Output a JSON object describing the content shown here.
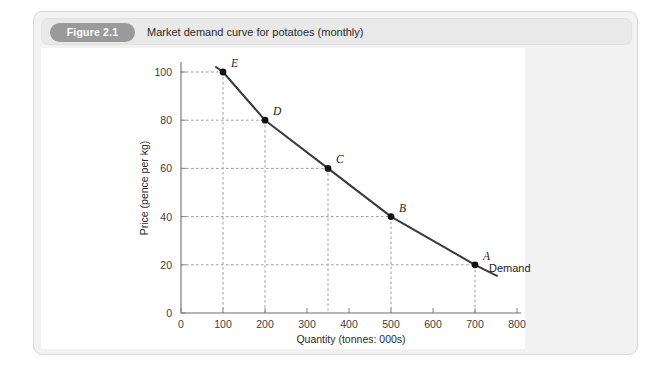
{
  "figure": {
    "badge": "Figure 2.1",
    "title": "Market demand curve for potatoes (monthly)"
  },
  "colors": {
    "card_background": "#f2f2f2",
    "header_background": "#e9e9e9",
    "badge_background": "#9a9a9a",
    "plot_background": "#ffffff",
    "curve": "#3a3a3a",
    "gridline": "#9b9b9b",
    "axis": "#6f6f6f"
  },
  "chart_data": {
    "type": "line",
    "title": "Market demand curve for potatoes (monthly)",
    "xlabel": "Quantity (tonnes: 000s)",
    "ylabel": "Price (pence per kg)",
    "xlim": [
      0,
      800
    ],
    "ylim": [
      0,
      110
    ],
    "xticks": [
      0,
      100,
      200,
      300,
      400,
      500,
      600,
      700,
      800
    ],
    "yticks": [
      0,
      20,
      40,
      60,
      80,
      100
    ],
    "grid": "dashed-to-axes",
    "legend": "inline-label",
    "series": [
      {
        "name": "Demand",
        "label": "Demand",
        "points": [
          {
            "label": "E",
            "x": 100,
            "y": 100
          },
          {
            "label": "D",
            "x": 200,
            "y": 80
          },
          {
            "label": "C",
            "x": 350,
            "y": 60
          },
          {
            "label": "B",
            "x": 500,
            "y": 40
          },
          {
            "label": "A",
            "x": 700,
            "y": 20
          }
        ]
      }
    ],
    "annotations": [
      {
        "text": "E",
        "x": 100,
        "y": 100
      },
      {
        "text": "D",
        "x": 200,
        "y": 80
      },
      {
        "text": "C",
        "x": 350,
        "y": 60
      },
      {
        "text": "B",
        "x": 500,
        "y": 40
      },
      {
        "text": "A",
        "x": 700,
        "y": 20
      },
      {
        "text": "Demand",
        "x": 760,
        "y": 14
      }
    ]
  }
}
